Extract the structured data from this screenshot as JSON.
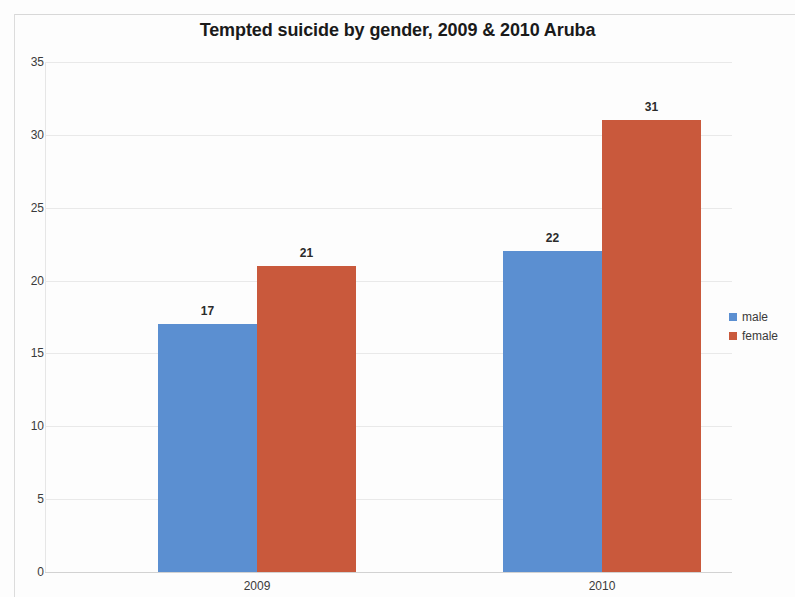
{
  "chart_data": {
    "type": "bar",
    "title": "Tempted suicide by gender, 2009 & 2010 Aruba",
    "xlabel": "",
    "ylabel": "",
    "categories": [
      "2009",
      "2010"
    ],
    "series": [
      {
        "name": "male",
        "color": "#5b8fd1",
        "values": [
          17,
          22
        ]
      },
      {
        "name": "female",
        "color": "#c9593c",
        "values": [
          21,
          31
        ]
      }
    ],
    "ylim": [
      0,
      35
    ],
    "ytick_step": 5,
    "yticks": [
      "0",
      "5",
      "10",
      "15",
      "20",
      "25",
      "30",
      "35"
    ],
    "grid": true,
    "data_labels": true,
    "legend_position": "right"
  },
  "legend": {
    "items": [
      {
        "label": "male"
      },
      {
        "label": "female"
      }
    ]
  }
}
